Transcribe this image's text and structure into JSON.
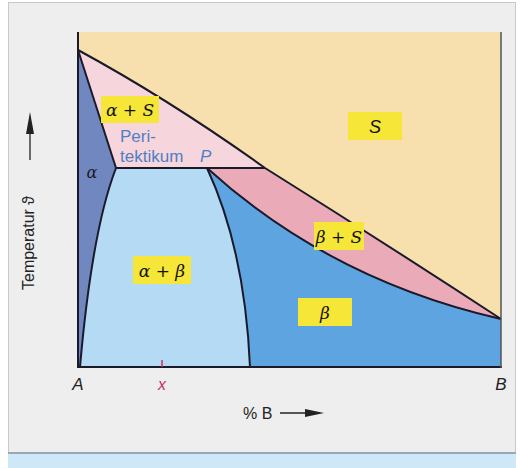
{
  "figure": {
    "y_axis_label": "Temperatur ϑ",
    "x_axis_label": "% B",
    "x_left_label": "A",
    "x_right_label": "B",
    "x_marker_label": "x",
    "regions": {
      "liquid": "S",
      "alpha": "α",
      "alpha_plus_liquid": "α + S",
      "beta": "β",
      "beta_plus_liquid": "β + S",
      "alpha_plus_beta": "α + β"
    },
    "peritectic_label_line1": "Peri-",
    "peritectic_label_line2": "tektikum",
    "peritectic_point": "P",
    "colors": {
      "liquid": "#f8dfae",
      "alpha_plus_liquid": "#f6d6dc",
      "beta_plus_liquid": "#eaaab8",
      "alpha": "#7088bf",
      "alpha_plus_beta": "#b5daf3",
      "beta": "#5ea4e0",
      "label_bg": "#f5e637",
      "peritectic_text": "#4f7fc4",
      "marker": "#c8325a"
    }
  }
}
